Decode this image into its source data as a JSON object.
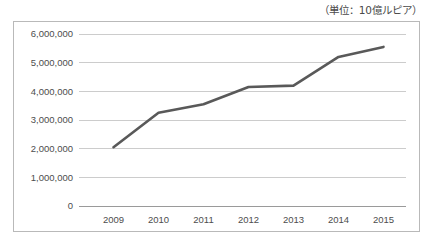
{
  "caption": {
    "unit_note": "（単位：10億ルピア）"
  },
  "chart_data": {
    "type": "line",
    "title": "",
    "subtitle": "",
    "xlabel": "",
    "ylabel": "",
    "unit_note": "（単位：10億ルピア）",
    "categories": [
      "2009",
      "2010",
      "2011",
      "2012",
      "2013",
      "2014",
      "2015"
    ],
    "values": [
      2050000,
      3250000,
      3550000,
      4150000,
      4200000,
      5200000,
      5550000
    ],
    "series": [
      {
        "name": "",
        "values": [
          2050000,
          3250000,
          3550000,
          4150000,
          4200000,
          5200000,
          5550000
        ]
      }
    ],
    "ylim": [
      0,
      6000000
    ],
    "ytick_values": [
      0,
      1000000,
      2000000,
      3000000,
      4000000,
      5000000,
      6000000
    ],
    "ytick_labels": [
      "0",
      "1,000,000",
      "2,000,000",
      "3,000,000",
      "4,000,000",
      "5,000,000",
      "6,000,000"
    ],
    "xtick_labels": [
      "2009",
      "2010",
      "2011",
      "2012",
      "2013",
      "2014",
      "2015"
    ],
    "grid": true,
    "grid_axis": "y",
    "legend": false,
    "legend_position": "none",
    "line_color": "#595959",
    "grid_color": "#bfbfbf",
    "axis_color": "#9a9a9a",
    "border_color": "#b9b9b9",
    "background_color": "#ffffff",
    "markers": false,
    "annotations": []
  }
}
